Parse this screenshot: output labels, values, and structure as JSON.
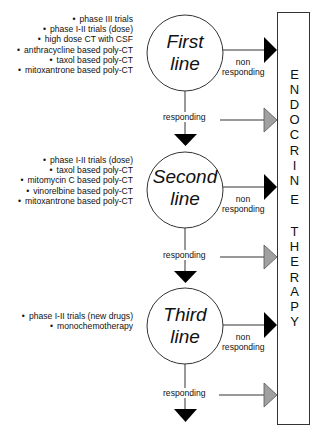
{
  "lines": [
    {
      "title_line1": "First",
      "title_line2": "line",
      "treatments": [
        "phase III trials",
        "phase I-II trials (dose)",
        "high dose CT with CSF",
        "anthracycline based poly-CT",
        "taxol based poly-CT",
        "mitoxantrone based poly-CT"
      ],
      "non_responding": [
        "non",
        "responding"
      ],
      "responding": "responding"
    },
    {
      "title_line1": "Second",
      "title_line2": "line",
      "treatments": [
        "phase I-II trials (dose)",
        "taxol based poly-CT",
        "mitomycin C based poly-CT",
        "vinorelbine based poly-CT",
        "mitoxantrone based poly-CT"
      ],
      "non_responding": [
        "non",
        "responding"
      ],
      "responding": "responding"
    },
    {
      "title_line1": "Third",
      "title_line2": "line",
      "treatments": [
        "phase I-II trials (new drugs)",
        "monochemotherapy"
      ],
      "non_responding": [
        "non",
        "responding"
      ],
      "responding": "responding"
    }
  ],
  "endocrine_box": {
    "word1": [
      "E",
      "N",
      "D",
      "O",
      "C",
      "R",
      "I",
      "N",
      "E"
    ],
    "word2": [
      "T",
      "H",
      "E",
      "R",
      "A",
      "P",
      "Y"
    ]
  },
  "colors": {
    "non_responding_arrow": "#000000",
    "responding_arrow": "#a0a0a0",
    "stroke": "#333333"
  }
}
